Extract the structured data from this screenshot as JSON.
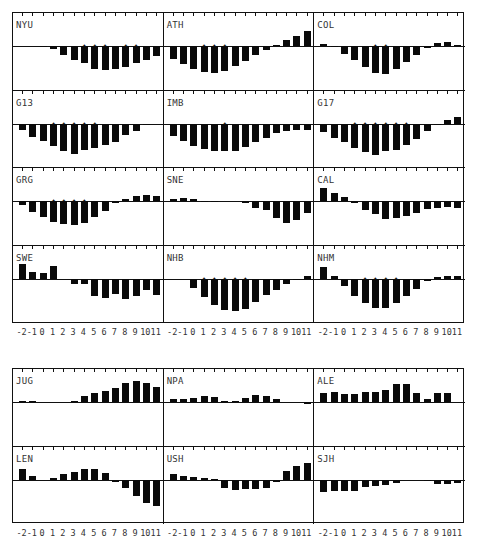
{
  "chart_data": [
    {
      "type": "bar",
      "title": "Top panel group",
      "xlabel": "",
      "ylabel": "",
      "categories": [
        "-2",
        "-1",
        "0",
        "1",
        "2",
        "3",
        "4",
        "5",
        "6",
        "7",
        "8",
        "9",
        "10",
        "11"
      ],
      "grid": false,
      "panels": [
        {
          "name": "NYU",
          "values": [
            0,
            0,
            0.5,
            -3,
            -9,
            -14,
            -17,
            -23,
            -24,
            -23,
            -21,
            -17,
            -14,
            -10
          ],
          "stars": [
            6,
            7,
            8,
            10,
            11
          ]
        },
        {
          "name": "ATH",
          "values": [
            -13,
            -18,
            -23,
            -26,
            -27,
            -25,
            -20,
            -15,
            -9,
            -4,
            1,
            6,
            10,
            15
          ],
          "stars": [
            3,
            4,
            5
          ]
        },
        {
          "name": "COL",
          "values": [
            2,
            -1,
            -8,
            -14,
            -21,
            -27,
            -28,
            -23,
            -16,
            -9,
            -2,
            3,
            4,
            1
          ],
          "stars": [
            5,
            6
          ]
        },
        {
          "name": "G13",
          "values": [
            -6,
            -13,
            -17,
            -22,
            -27,
            -30,
            -26,
            -24,
            -21,
            -18,
            -11,
            -7,
            -1,
            0
          ],
          "stars": [
            3,
            4,
            5,
            6,
            7
          ]
        },
        {
          "name": "IMB",
          "values": [
            -12,
            -17,
            -22,
            -25,
            -27,
            -27,
            -27,
            -23,
            -18,
            -14,
            -9,
            -7,
            -6,
            -6
          ],
          "stars": [
            5
          ]
        },
        {
          "name": "G17",
          "values": [
            -8,
            -14,
            -18,
            -24,
            -28,
            -31,
            -27,
            -26,
            -21,
            -15,
            -7,
            -1,
            4,
            7
          ],
          "stars": [
            3,
            4,
            5,
            6,
            7,
            8
          ]
        },
        {
          "name": "GRG",
          "values": [
            -4,
            -11,
            -16,
            -21,
            -23,
            -24,
            -22,
            -16,
            -10,
            -2,
            2,
            5,
            6,
            5
          ],
          "stars": [
            3,
            4,
            5,
            6
          ]
        },
        {
          "name": "SNE",
          "values": [
            2,
            3,
            2,
            -1,
            -1,
            0,
            0,
            -2,
            -7,
            -9,
            -17,
            -22,
            -19,
            -12
          ],
          "stars": []
        },
        {
          "name": "CAL",
          "values": [
            13,
            8,
            4,
            -2,
            -9,
            -13,
            -18,
            -17,
            -15,
            -12,
            -8,
            -7,
            -6,
            -7
          ],
          "stars": []
        },
        {
          "name": "SWE",
          "values": [
            15,
            7,
            6,
            13,
            0,
            -5,
            -5,
            -17,
            -19,
            -15,
            -20,
            -17,
            -11,
            -16
          ],
          "stars": []
        },
        {
          "name": "NHB",
          "values": [
            0,
            0,
            -9,
            -18,
            -26,
            -31,
            -32,
            -30,
            -23,
            -16,
            -11,
            -5,
            -1,
            3
          ],
          "stars": [
            3,
            4,
            5,
            6,
            7
          ]
        },
        {
          "name": "NHM",
          "values": [
            12,
            3,
            -7,
            -17,
            -24,
            -29,
            -29,
            -24,
            -17,
            -10,
            -2,
            2,
            3,
            3
          ],
          "stars": [
            4,
            5,
            6,
            7
          ]
        }
      ]
    },
    {
      "type": "bar",
      "title": "Bottom panel group",
      "xlabel": "",
      "ylabel": "",
      "categories": [
        "-2",
        "-1",
        "0",
        "1",
        "2",
        "3",
        "4",
        "5",
        "6",
        "7",
        "8",
        "9",
        "10",
        "11"
      ],
      "grid": false,
      "panels": [
        {
          "name": "JUG",
          "values": [
            1,
            1,
            0,
            0,
            0,
            1,
            6,
            9,
            11,
            14,
            19,
            21,
            19,
            15
          ],
          "stars": []
        },
        {
          "name": "NPA",
          "values": [
            3,
            3,
            4,
            6,
            5,
            1,
            1,
            4,
            7,
            6,
            3,
            0,
            0,
            -2
          ],
          "stars": []
        },
        {
          "name": "ALE",
          "values": [
            9,
            10,
            8,
            8,
            10,
            10,
            12,
            18,
            18,
            9,
            3,
            9,
            9,
            0
          ],
          "stars": []
        },
        {
          "name": "LEN",
          "values": [
            11,
            4,
            0,
            2,
            6,
            8,
            11,
            11,
            7,
            -2,
            -8,
            -16,
            -23,
            -26
          ],
          "stars": []
        },
        {
          "name": "USH",
          "values": [
            6,
            4,
            3,
            2,
            1,
            -8,
            -10,
            -9,
            -9,
            -8,
            -2,
            9,
            14,
            17
          ],
          "stars": []
        },
        {
          "name": "SJH",
          "values": [
            -12,
            -11,
            -11,
            -11,
            -7,
            -6,
            -5,
            -3,
            0,
            0,
            -1,
            -4,
            -4,
            -3
          ],
          "stars": []
        }
      ]
    }
  ],
  "axis": {
    "tick_labels": [
      "-2",
      "-1",
      "0",
      "1",
      "2",
      "3",
      "4",
      "5",
      "6",
      "7",
      "8",
      "9",
      "10",
      "11"
    ]
  }
}
